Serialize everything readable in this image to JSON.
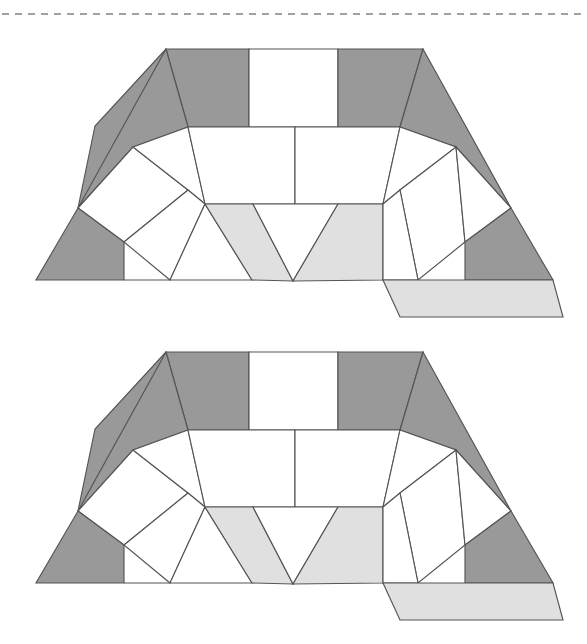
{
  "page": {
    "width": 587,
    "height": 644,
    "background": "#ffffff"
  },
  "colors": {
    "white": "#ffffff",
    "dark_gray": "#999999",
    "light_gray": "#e0e0e0",
    "stroke": "#555555",
    "rule": "#444444"
  },
  "separator": {
    "type": "dashed-horizontal-rule",
    "y": 14,
    "x_start": 2,
    "x_end": 585,
    "dash": "7 6"
  },
  "figures": [
    {
      "id": "figure-top",
      "offset_y": 0,
      "label": "arch tiling figure 1"
    },
    {
      "id": "figure-bottom",
      "offset_y": 303,
      "label": "arch tiling figure 2"
    }
  ],
  "chart_data": {
    "type": "diagram",
    "repeat_count": 2,
    "repeat_offset_y": 303,
    "tile_counts": {
      "white": 12,
      "dark_gray": 6,
      "light_gray": 3,
      "total": 21
    },
    "tiles": [
      {
        "name": "left-outer-apex-triangle",
        "fill": "dark_gray",
        "points": "166,49 95,126 78,208 133,147"
      },
      {
        "name": "left-top-dark-quad",
        "fill": "dark_gray",
        "points": "166,49 249,49 249,127 188,127"
      },
      {
        "name": "left-top-dark-inner",
        "fill": "dark_gray",
        "points": "166,49 188,127 133,147 78,208"
      },
      {
        "name": "top-center-white-rect",
        "fill": "white",
        "points": "249,49 338,49 338,127 249,127"
      },
      {
        "name": "right-top-dark-quad",
        "fill": "dark_gray",
        "points": "338,49 423,49 400,127 338,127"
      },
      {
        "name": "right-outer-apex-triangle",
        "fill": "dark_gray",
        "points": "423,49 511,208 456,147 400,127"
      },
      {
        "name": "left-leg-upper-white",
        "fill": "white",
        "points": "78,208 133,147 188,190 124,242"
      },
      {
        "name": "left-leg-lower-dark",
        "fill": "dark_gray",
        "points": "78,208 124,242 124,280 36,280"
      },
      {
        "name": "left-leg-inner-upper-white",
        "fill": "white",
        "points": "133,147 188,127 205,204 188,190"
      },
      {
        "name": "left-leg-mid-white",
        "fill": "white",
        "points": "124,242 188,190 205,204 170,280"
      },
      {
        "name": "left-leg-bottom-white",
        "fill": "white",
        "points": "124,280 170,280 205,204 252,280"
      },
      {
        "name": "center-left-white-quad",
        "fill": "white",
        "points": "188,127 295,127 295,204 205,204"
      },
      {
        "name": "center-right-white-quad",
        "fill": "white",
        "points": "295,127 400,127 383,204 295,204"
      },
      {
        "name": "notch-left-light-gray",
        "fill": "light_gray",
        "points": "253,204 293,281 252,280 205,204"
      },
      {
        "name": "notch-center-white-triangle",
        "fill": "white",
        "points": "253,204 338,204 293,281"
      },
      {
        "name": "notch-right-light-gray",
        "fill": "light_gray",
        "points": "338,204 383,204 383,280 293,281"
      },
      {
        "name": "right-leg-inner-upper-white",
        "fill": "white",
        "points": "400,127 456,147 400,190 383,204"
      },
      {
        "name": "right-leg-mid-white",
        "fill": "white",
        "points": "400,190 456,147 465,242 418,280"
      },
      {
        "name": "right-leg-bottom-white",
        "fill": "white",
        "points": "383,204 400,190 418,280 383,280"
      },
      {
        "name": "right-leg-upper-white",
        "fill": "white",
        "points": "456,147 511,208 465,242 456,147"
      },
      {
        "name": "right-leg-outer-dark",
        "fill": "dark_gray",
        "points": "511,208 553,280 465,280 465,242"
      },
      {
        "name": "bottom-right-light-gray-flap",
        "fill": "light_gray",
        "points": "383,280 553,280 563,317 400,317"
      }
    ],
    "key_vertices": {
      "top_left_apex": [
        166,
        49
      ],
      "top_right_apex": [
        423,
        49
      ],
      "top_edge_y": 49,
      "bottom_edge_y": 280,
      "left_bottom_corner": [
        36,
        280
      ],
      "right_bottom_corner": [
        553,
        280
      ],
      "notch_bottom": [
        293,
        281
      ],
      "notch_top_y": 204,
      "flap_bottom_y": 317
    }
  }
}
